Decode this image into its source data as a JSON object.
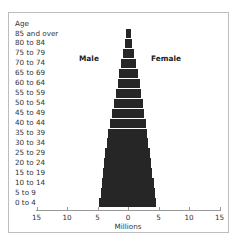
{
  "chart_data": {
    "type": "bar",
    "subtype": "population-pyramid",
    "title": "",
    "xlabel": "Millions",
    "ylabel": "Age",
    "xlim": [
      -15,
      15
    ],
    "xticks": [
      -15,
      -10,
      -5,
      0,
      5,
      10,
      15
    ],
    "xtick_labels": [
      "15",
      "10",
      "5",
      "0",
      "5",
      "10",
      "15"
    ],
    "legend": [
      "Male",
      "Female"
    ],
    "categories": [
      "85 and over",
      "80 to 84",
      "75 to 79",
      "70 to 74",
      "65 to 69",
      "60 to 64",
      "55 to 59",
      "50 to 54",
      "45 to 49",
      "40 to 44",
      "35 to 39",
      "30 to 34",
      "25 to 29",
      "20 to 24",
      "15 to 19",
      "10 to 14",
      "5 to 9",
      "0 to 4"
    ],
    "series": [
      {
        "name": "Male",
        "color": "#262626",
        "values": [
          0.3,
          0.5,
          0.8,
          1.1,
          1.4,
          1.7,
          2.0,
          2.3,
          2.6,
          2.9,
          3.2,
          3.4,
          3.7,
          3.9,
          4.1,
          4.3,
          4.5,
          4.7
        ]
      },
      {
        "name": "Female",
        "color": "#262626",
        "values": [
          0.5,
          0.7,
          1.0,
          1.3,
          1.6,
          1.9,
          2.1,
          2.4,
          2.6,
          2.9,
          3.1,
          3.3,
          3.6,
          3.8,
          4.0,
          4.2,
          4.4,
          4.6
        ]
      }
    ],
    "grid": false
  },
  "labels": {
    "age_header": "Age",
    "male": "Male",
    "female": "Female",
    "xlabel": "Millions"
  }
}
